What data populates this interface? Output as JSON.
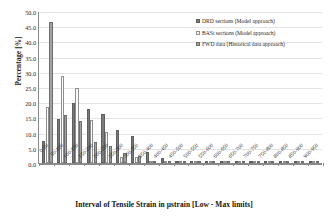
{
  "chart_data": {
    "type": "bar",
    "title": "",
    "xlabel": "Interval of Tensile Strain in µstrain [Low - Max limits]",
    "ylabel": "Percentage [%]",
    "ylim": [
      0,
      50
    ],
    "ytick_step": 5,
    "ytick_labels": [
      "50.0",
      "45.0",
      "40.0",
      "35.0",
      "30.0",
      "25.0",
      "20.0",
      "15.0",
      "10.0",
      "5.0",
      "0.0"
    ],
    "grid": true,
    "grid_axis": "y",
    "legend_position": "top-right",
    "categories": [
      "0-50",
      "50-100",
      "100-150",
      "150-200",
      "200-250",
      "250-300",
      "300-350",
      "350-400",
      "400-450",
      "450-500",
      "500-550",
      "550-600",
      "600-650",
      "650-700",
      "700-750",
      "750-800",
      "800-850",
      "850-900",
      "900-950"
    ],
    "series": [
      {
        "name": "DRD sections (Model approach)",
        "color": "#7b7b7b",
        "values": [
          7.2,
          14.4,
          19.9,
          17.9,
          16.1,
          10.8,
          8.9,
          3.7,
          1.8,
          0.5,
          0.4,
          0.3,
          0.3,
          0.3,
          0.3,
          0.3,
          0.3,
          0.2,
          0.2
        ]
      },
      {
        "name": "BASt sections (Model approach)",
        "color": "#fbfbfb",
        "values": [
          18.4,
          28.5,
          24.6,
          14.3,
          10.2,
          2.0,
          2.1,
          0.0,
          0.0,
          0.0,
          0.0,
          0.0,
          0.0,
          0.0,
          0.0,
          0.0,
          0.0,
          0.0,
          0.0
        ]
      },
      {
        "name": "FWD data (Historical data approach)",
        "color": "#a2a2a2",
        "values": [
          46.3,
          15.7,
          13.8,
          7.0,
          5.5,
          3.2,
          2.2,
          0.4,
          0.4,
          0.2,
          0.2,
          0.2,
          0.2,
          0.2,
          0.2,
          0.2,
          0.2,
          0.2,
          0.2
        ]
      }
    ]
  }
}
